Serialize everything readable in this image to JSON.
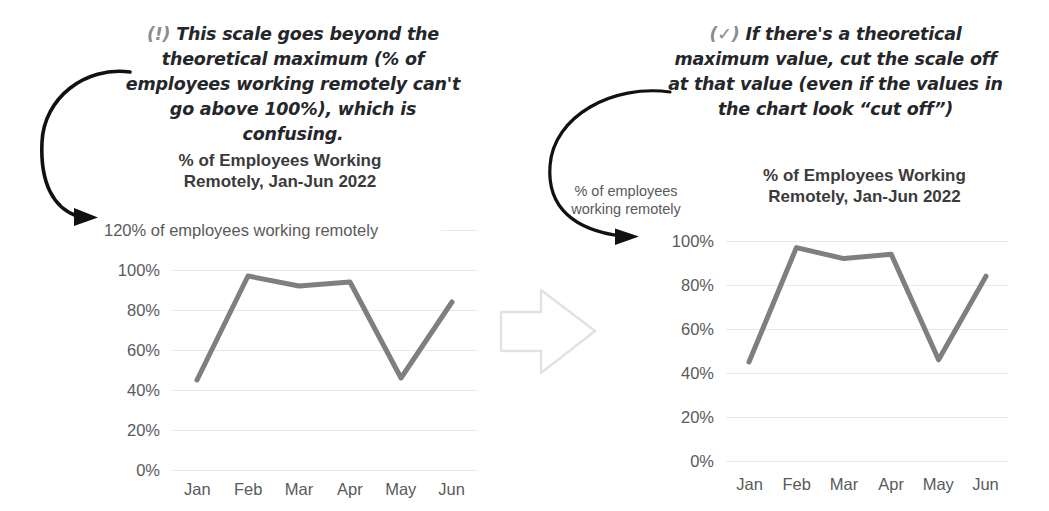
{
  "annotations": {
    "left": {
      "marker": "(!)",
      "text": "This scale goes beyond the\ntheoretical maximum (% of\nemployees working remotely can't\ngo above 100%), which is confusing."
    },
    "right": {
      "marker": "(✓)",
      "text": "If there's a theoretical\nmaximum value, cut the scale off\nat that value (even if the values in\nthe chart look “cut off”)"
    }
  },
  "icons": {
    "transition_arrow": "right-arrow-icon",
    "left_pointer": "curved-arrow-icon",
    "right_pointer": "curved-arrow-icon"
  },
  "colors": {
    "line": "#7f7f7f",
    "grid": "#e9e9e9",
    "tick_text": "#5a5a5a",
    "title_text": "#3b3b3b",
    "annotation_text": "#25262a",
    "marker_text": "#8c8c8c",
    "transition_arrow_outline": "#e2e2e2"
  },
  "chart_data": [
    {
      "id": "bad-chart",
      "type": "line",
      "title": "% of Employees Working\nRemotely, Jan-Jun 2022",
      "categories": [
        "Jan",
        "Feb",
        "Mar",
        "Apr",
        "May",
        "Jun"
      ],
      "values": [
        45,
        97,
        92,
        94,
        46,
        84
      ],
      "series": [
        {
          "name": "% of employees working remotely",
          "values": [
            45,
            97,
            92,
            94,
            46,
            84
          ]
        }
      ],
      "xlabel": "",
      "ylabel": "",
      "ylim": [
        0,
        120
      ],
      "yticks": [
        0,
        20,
        40,
        60,
        80,
        100,
        120
      ],
      "ytick_labels": [
        "0%",
        "20%",
        "40%",
        "60%",
        "80%",
        "100%",
        "120% of employees working remotely"
      ],
      "grid": true,
      "legend": "none"
    },
    {
      "id": "good-chart",
      "type": "line",
      "title": "% of Employees Working\nRemotely, Jan-Jun 2022",
      "categories": [
        "Jan",
        "Feb",
        "Mar",
        "Apr",
        "May",
        "Jun"
      ],
      "values": [
        45,
        97,
        92,
        94,
        46,
        84
      ],
      "series": [
        {
          "name": "% of employees working remotely",
          "values": [
            45,
            97,
            92,
            94,
            46,
            84
          ]
        }
      ],
      "axis_caption": "% of employees\nworking remotely",
      "xlabel": "",
      "ylabel": "",
      "ylim": [
        0,
        100
      ],
      "yticks": [
        0,
        20,
        40,
        60,
        80,
        100
      ],
      "ytick_labels": [
        "0%",
        "20%",
        "40%",
        "60%",
        "80%",
        "100%"
      ],
      "grid": true,
      "legend": "none"
    }
  ]
}
